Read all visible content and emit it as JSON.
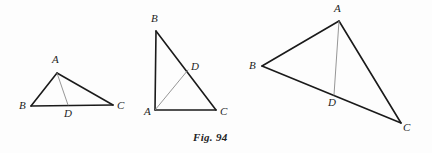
{
  "figure": {
    "caption": "Fig. 94",
    "caption_position": {
      "x": 193,
      "y": 131
    },
    "canvas": {
      "width": 432,
      "height": 153
    },
    "background_color": "#fdfdfd",
    "side_stroke_color": "#1a1a1a",
    "cevian_stroke_color": "#8a8a8a",
    "side_stroke_width": 1.6,
    "cevian_stroke_width": 0.9,
    "label_color": "#1d1d1d"
  },
  "diagrams": [
    {
      "name": "acute-triangle-with-cevian",
      "description": "Triangle ABC with cevian AD drawn from apex A to point D on side BC; D lies between B and C.",
      "points": {
        "A": {
          "x": 57,
          "y": 73
        },
        "B": {
          "x": 31,
          "y": 106
        },
        "C": {
          "x": 113,
          "y": 105
        },
        "D": {
          "x": 68,
          "y": 105
        }
      },
      "sides": [
        {
          "from": "A",
          "to": "B"
        },
        {
          "from": "B",
          "to": "C"
        },
        {
          "from": "C",
          "to": "A"
        }
      ],
      "cevians": [
        {
          "from": "A",
          "to": "D"
        }
      ],
      "labels": [
        {
          "text": "A",
          "x": 52,
          "y": 54
        },
        {
          "text": "B",
          "x": 19,
          "y": 100
        },
        {
          "text": "C",
          "x": 117,
          "y": 100
        },
        {
          "text": "D",
          "x": 64,
          "y": 108
        }
      ]
    },
    {
      "name": "right-triangle-with-cevian",
      "description": "Right triangle with vertical side AB, horizontal side AC and hypotenuse BC; cevian AD runs from the right-angle vertex A to point D on hypotenuse BC.",
      "points": {
        "A": {
          "x": 155,
          "y": 110
        },
        "B": {
          "x": 156,
          "y": 31
        },
        "C": {
          "x": 216,
          "y": 110
        },
        "D": {
          "x": 188,
          "y": 70
        }
      },
      "sides": [
        {
          "from": "A",
          "to": "B"
        },
        {
          "from": "B",
          "to": "C"
        },
        {
          "from": "C",
          "to": "A"
        }
      ],
      "cevians": [
        {
          "from": "A",
          "to": "D"
        }
      ],
      "labels": [
        {
          "text": "B",
          "x": 151,
          "y": 13
        },
        {
          "text": "D",
          "x": 191,
          "y": 61
        },
        {
          "text": "A",
          "x": 144,
          "y": 106
        },
        {
          "text": "C",
          "x": 220,
          "y": 106
        }
      ]
    },
    {
      "name": "obtuse-triangle-with-cevian",
      "description": "Large triangle ABC with cevian AD from apex A down to point D on the long side BC.",
      "points": {
        "A": {
          "x": 339,
          "y": 21
        },
        "B": {
          "x": 262,
          "y": 66
        },
        "C": {
          "x": 401,
          "y": 123
        },
        "D": {
          "x": 334,
          "y": 95
        }
      },
      "sides": [
        {
          "from": "A",
          "to": "B"
        },
        {
          "from": "B",
          "to": "C"
        },
        {
          "from": "C",
          "to": "A"
        }
      ],
      "cevians": [
        {
          "from": "A",
          "to": "D"
        }
      ],
      "labels": [
        {
          "text": "A",
          "x": 334,
          "y": 3
        },
        {
          "text": "B",
          "x": 249,
          "y": 60
        },
        {
          "text": "D",
          "x": 328,
          "y": 97
        },
        {
          "text": "C",
          "x": 403,
          "y": 122
        }
      ]
    }
  ]
}
